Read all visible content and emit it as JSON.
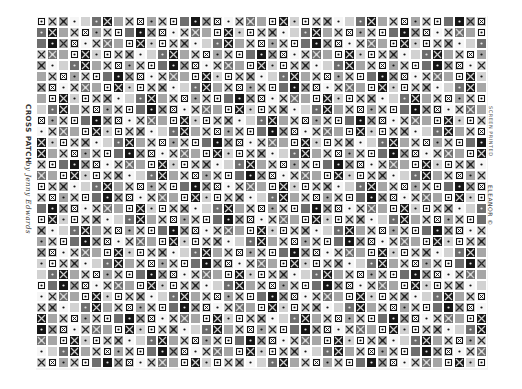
{
  "artwork": {
    "title": "CROSS PATCH",
    "author": "by Jenny Edwards",
    "right_note": "SCREEN PRINTED",
    "right_brand": "ELEANOR ©",
    "copyright_symbol": "©"
  },
  "pattern": {
    "tile_size": 11,
    "cols": 41,
    "rows": 32,
    "palette": {
      "white": "#f6f6f6",
      "light": "#d2d2d2",
      "mid": "#a6a6a6",
      "dark": "#6e6e6e",
      "black": "#161616",
      "line": "#111111"
    },
    "motifs": [
      "plain",
      "cross",
      "dot",
      "boxed-dot",
      "boxed-cross",
      "cross-dot"
    ],
    "sequence": [
      [
        "white",
        "boxed-dot"
      ],
      [
        "light",
        "cross"
      ],
      [
        "mid",
        "cross-dot"
      ],
      [
        "white",
        "dot"
      ],
      [
        "light",
        "plain"
      ],
      [
        "dark",
        "dot"
      ],
      [
        "black",
        "cross"
      ],
      [
        "mid",
        "plain"
      ],
      [
        "light",
        "cross"
      ],
      [
        "white",
        "boxed-cross"
      ],
      [
        "mid",
        "dot"
      ],
      [
        "light",
        "cross"
      ],
      [
        "white",
        "boxed-dot"
      ],
      [
        "dark",
        "plain"
      ],
      [
        "black",
        "dot"
      ],
      [
        "mid",
        "cross"
      ],
      [
        "light",
        "boxed-cross"
      ],
      [
        "white",
        "dot"
      ],
      [
        "light",
        "cross"
      ],
      [
        "dark",
        "cross-dot"
      ],
      [
        "mid",
        "plain"
      ],
      [
        "white",
        "boxed-dot"
      ],
      [
        "black",
        "cross"
      ],
      [
        "light",
        "dot"
      ]
    ]
  }
}
